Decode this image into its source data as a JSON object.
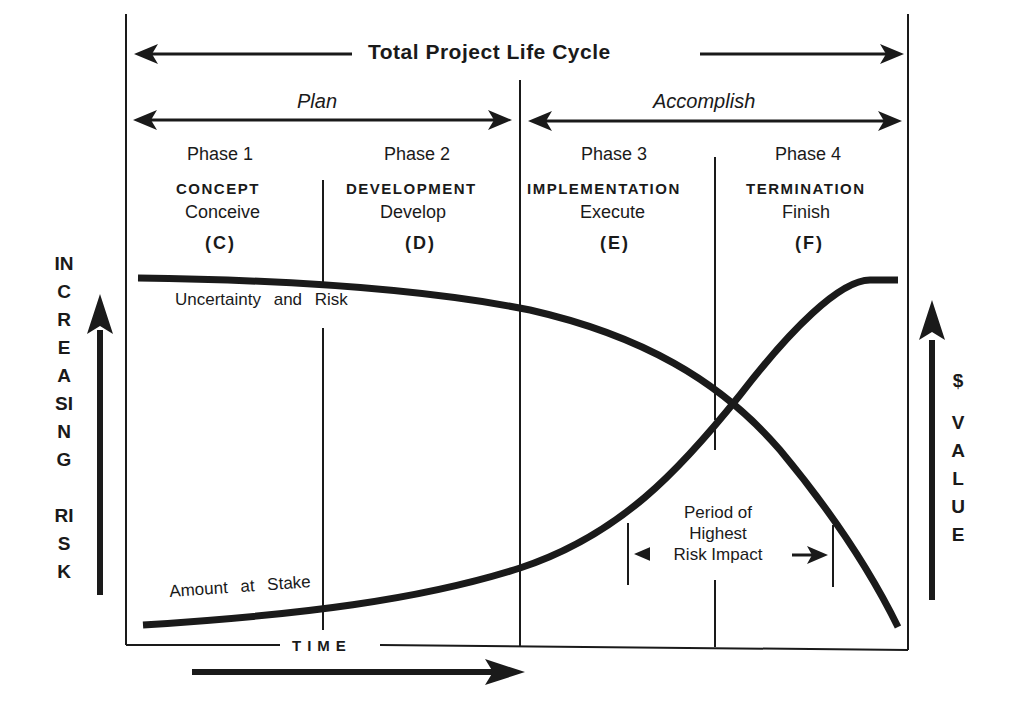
{
  "header": {
    "title": "Total Project Life Cycle",
    "stages": [
      {
        "label": "Plan"
      },
      {
        "label": "Accomplish"
      }
    ]
  },
  "phases": [
    {
      "phase": "Phase 1",
      "name": "CONCEPT",
      "verb": "Conceive",
      "letter": "(C)"
    },
    {
      "phase": "Phase 2",
      "name": "DEVELOPMENT",
      "verb": "Develop",
      "letter": "(D)"
    },
    {
      "phase": "Phase 3",
      "name": "IMPLEMENTATION",
      "verb": "Execute",
      "letter": "(E)"
    },
    {
      "phase": "Phase 4",
      "name": "TERMINATION",
      "verb": "Finish",
      "letter": "(F)"
    }
  ],
  "curves": {
    "risk_label": "Uncertainty and Risk",
    "stake_label": "Amount at Stake"
  },
  "axes": {
    "left_label_top": "INCREASING",
    "left_label_bottom": "RISK",
    "right_label_top": "$",
    "right_label_bottom": "VALUE",
    "x_label": "TIME"
  },
  "annotation": {
    "line1": "Period of",
    "line2": "Highest",
    "line3": "Risk Impact"
  },
  "colors": {
    "ink": "#1a1a1a",
    "background": "#ffffff"
  }
}
